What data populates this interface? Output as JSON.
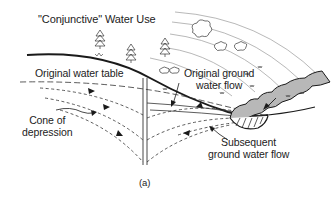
{
  "figure": {
    "title": "\"Conjunctive\" Water Use",
    "caption": "(a)",
    "labels": {
      "original_water_table": "Original water table",
      "original_ground_water_flow_line1": "Original ground",
      "original_ground_water_flow_line2": "water flow",
      "cone_of_depression_line1": "Cone of",
      "cone_of_depression_line2": "depression",
      "subsequent_flow_line1": "Subsequent",
      "subsequent_flow_line2": "ground water flow"
    },
    "colors": {
      "line": "#1a1a1a",
      "river_fill": "#b8b8b8",
      "background": "#ffffff"
    },
    "icons": [
      "tree-icon",
      "shrub-icon",
      "grass-tuft-icon",
      "well-icon",
      "river-icon",
      "flow-arrow-icon"
    ]
  }
}
